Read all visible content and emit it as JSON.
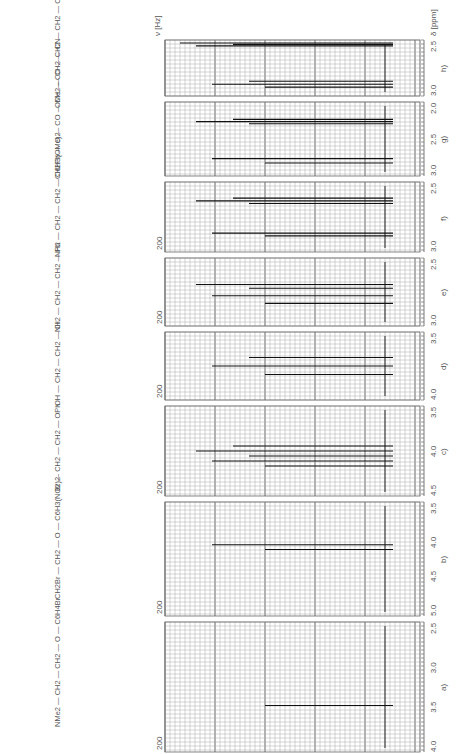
{
  "figure": {
    "y_axis_label": "ν [Hz]",
    "x_axis_label": "δ [ppm]"
  },
  "panels": [
    {
      "id": "h",
      "label": "h)",
      "molecule": [
        "OMe",
        "CO",
        "CH2",
        "CH2",
        "CN"
      ],
      "top": 40,
      "bottom": 96,
      "ticks": [
        {
          "ppm": "3.0",
          "x": 412
        },
        {
          "ppm": "2.5",
          "x": 400
        }
      ],
      "hz_label": ""
    },
    {
      "id": "g",
      "label": "g)",
      "molecule": [
        "CH2Ph",
        "O",
        "CO",
        "CH2",
        "CH2",
        "CN"
      ],
      "top": 102,
      "bottom": 176,
      "ticks": [
        {
          "ppm": "3.0",
          "x": 412
        },
        {
          "ppm": "2.5",
          "x": 400
        },
        {
          "ppm": "2.0",
          "x": 388
        }
      ],
      "hz_label": ""
    },
    {
      "id": "f",
      "label": "f)",
      "molecule": [
        "NH2",
        "CH2",
        "CH2",
        "C6H3(OMe)2"
      ],
      "top": 182,
      "bottom": 252,
      "ticks": [
        {
          "ppm": "3.0",
          "x": 412
        },
        {
          "ppm": "2.5",
          "x": 400
        }
      ],
      "hz_label": "200"
    },
    {
      "id": "e",
      "label": "e)",
      "molecule": [
        "NH2",
        "CH2",
        "CH2",
        "Ph"
      ],
      "top": 258,
      "bottom": 326,
      "ticks": [
        {
          "ppm": "3.0",
          "x": 412
        },
        {
          "ppm": "2.5",
          "x": 400
        }
      ],
      "hz_label": "200"
    },
    {
      "id": "d",
      "label": "d)",
      "molecule": [
        "OH",
        "CH2",
        "CH2",
        "Cl"
      ],
      "top": 332,
      "bottom": 400,
      "ticks": [
        {
          "ppm": "4.0",
          "x": 412
        },
        {
          "ppm": "3.5",
          "x": 400
        }
      ],
      "hz_label": "200"
    },
    {
      "id": "c",
      "label": "c)",
      "molecule": [
        "Br",
        "CH2",
        "CH2",
        "OPh"
      ],
      "top": 406,
      "bottom": 496,
      "ticks": [
        {
          "ppm": "4.5",
          "x": 412
        },
        {
          "ppm": "4.0",
          "x": 400
        },
        {
          "ppm": "3.5",
          "x": 388
        }
      ],
      "hz_label": "200"
    },
    {
      "id": "b",
      "label": "b)",
      "molecule": [
        "CH2Br",
        "CH2",
        "O",
        "C6H3(NO2)2"
      ],
      "top": 502,
      "bottom": 616,
      "ticks": [
        {
          "ppm": "5.0",
          "x": 412
        },
        {
          "ppm": "4.5",
          "x": 400
        },
        {
          "ppm": "4.0",
          "x": 388
        },
        {
          "ppm": "3.5",
          "x": 376
        }
      ],
      "hz_label": "200 / 300"
    },
    {
      "id": "a",
      "label": "a)",
      "molecule": [
        "NMe2",
        "CH2",
        "CH2",
        "O",
        "C6H4Br"
      ],
      "top": 622,
      "bottom": 752,
      "ticks": [
        {
          "ppm": "4.0",
          "x": 412
        },
        {
          "ppm": "3.5",
          "x": 400
        },
        {
          "ppm": "3.0",
          "x": 388
        },
        {
          "ppm": "2.5",
          "x": 376
        }
      ],
      "hz_label": "200"
    }
  ],
  "chart_data": {
    "type": "line",
    "xlabel": "δ [ppm]",
    "ylabel": "ν [Hz]",
    "grid": true,
    "legend_position": "none",
    "series": [
      {
        "name": "a) Me2N-CH2-CH2-O-C6H4Br",
        "ppm_range": [
          2.3,
          4.2
        ],
        "peaks_ppm": [
          2.6,
          2.7,
          2.8,
          4.0,
          4.05,
          4.1
        ]
      },
      {
        "name": "b) BrCH2-CH2-O-C6H3(NO2)2",
        "ppm_range": [
          3.4,
          5.1
        ],
        "peaks_ppm": [
          3.7,
          3.8,
          4.6,
          4.65,
          4.7
        ]
      },
      {
        "name": "c) Br-CH2-CH2-OPh",
        "ppm_range": [
          3.3,
          4.6
        ],
        "peaks_ppm": [
          3.6,
          3.65,
          4.2,
          4.25,
          4.3
        ]
      },
      {
        "name": "d) HO-CH2-CH2-Cl",
        "ppm_range": [
          3.3,
          4.2
        ],
        "peaks_ppm": [
          3.6,
          3.7,
          3.8,
          3.85
        ]
      },
      {
        "name": "e) H2N-CH2-CH2-Ph",
        "ppm_range": [
          2.4,
          3.2
        ],
        "peaks_ppm": [
          2.7,
          2.8,
          2.9
        ]
      },
      {
        "name": "f) H2N-CH2-CH2-C6H3(OMe)2",
        "ppm_range": [
          2.4,
          3.3
        ],
        "peaks_ppm": [
          2.7,
          2.75,
          2.8,
          2.85,
          2.9
        ]
      },
      {
        "name": "g) PhCH2-O-CO-CH2-CH2-CN",
        "ppm_range": [
          1.9,
          3.1
        ],
        "peaks_ppm": [
          2.6,
          2.65
        ]
      },
      {
        "name": "h) MeO-CO-CH2-CH2-CN",
        "ppm_range": [
          2.4,
          3.1
        ],
        "peaks_ppm": [
          2.65
        ]
      }
    ]
  }
}
